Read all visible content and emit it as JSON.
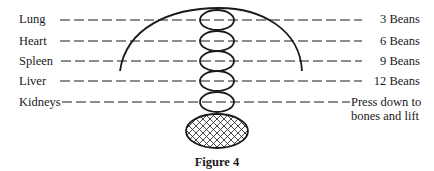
{
  "diagram": {
    "caption": "Figure 4",
    "rows": [
      {
        "organ": "Lung",
        "pressure": "3 Beans"
      },
      {
        "organ": "Heart",
        "pressure": "6 Beans"
      },
      {
        "organ": "Spleen",
        "pressure": "9 Beans"
      },
      {
        "organ": "Liver",
        "pressure": "12 Beans"
      },
      {
        "organ": "Kidneys",
        "pressure_line1": "Press down to",
        "pressure_line2": "bones and lift"
      }
    ],
    "colors": {
      "ink": "#1a1a1a",
      "background": "#ffffff"
    }
  }
}
